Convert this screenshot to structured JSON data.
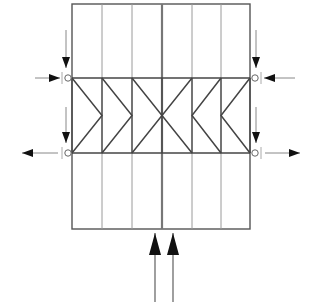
{
  "diagram": {
    "type": "truss-frame-load-diagram",
    "title": "",
    "colors": {
      "background": "#ffffff",
      "frame": "#555555",
      "column": "#9a9a9a",
      "center_column": "#777777",
      "chord": "#444444",
      "diagonal": "#444444",
      "arrow": "#111111",
      "arrow_shaft": "#888888",
      "pin": "#666666"
    },
    "frame": {
      "x": 72,
      "y": 4,
      "width": 178,
      "height": 225
    },
    "columns_x": [
      102,
      132,
      192,
      221
    ],
    "center_column_x": 162,
    "chords_y": {
      "top": 78,
      "bottom": 153
    },
    "panel_points_x": [
      72,
      102,
      132,
      162,
      192,
      221,
      250
    ],
    "pins": [
      {
        "name": "left-top-pin",
        "x": 68,
        "y": 78
      },
      {
        "name": "left-bottom-pin",
        "x": 68,
        "y": 153
      },
      {
        "name": "right-top-pin",
        "x": 255,
        "y": 78
      },
      {
        "name": "right-bottom-pin",
        "x": 255,
        "y": 153
      }
    ],
    "horizontal_arrows": [
      {
        "name": "left-top-inward-arrow",
        "y": 78,
        "from_x": 35,
        "to_x": 60,
        "direction": "right"
      },
      {
        "name": "left-bottom-outward-arrow",
        "y": 153,
        "from_x": 58,
        "to_x": 22,
        "direction": "left"
      },
      {
        "name": "right-top-inward-arrow",
        "y": 78,
        "from_x": 295,
        "to_x": 264,
        "direction": "left"
      },
      {
        "name": "right-bottom-outward-arrow",
        "y": 153,
        "from_x": 265,
        "to_x": 300,
        "direction": "right"
      }
    ],
    "vertical_arrows": [
      {
        "name": "left-top-down-arrow",
        "x": 66,
        "from_y": 30,
        "to_y": 68,
        "direction": "down"
      },
      {
        "name": "left-bottom-down-arrow",
        "x": 66,
        "from_y": 107,
        "to_y": 143,
        "direction": "down"
      },
      {
        "name": "right-top-down-arrow",
        "x": 256,
        "from_y": 30,
        "to_y": 68,
        "direction": "down"
      },
      {
        "name": "right-bottom-down-arrow",
        "x": 256,
        "from_y": 107,
        "to_y": 143,
        "direction": "down"
      },
      {
        "name": "bottom-left-up-arrow",
        "x": 155,
        "from_y": 302,
        "to_y": 233,
        "direction": "up"
      },
      {
        "name": "bottom-right-up-arrow",
        "x": 173,
        "from_y": 302,
        "to_y": 233,
        "direction": "up"
      }
    ],
    "pin_ticks_x": {
      "left": 62,
      "right": 261
    }
  }
}
